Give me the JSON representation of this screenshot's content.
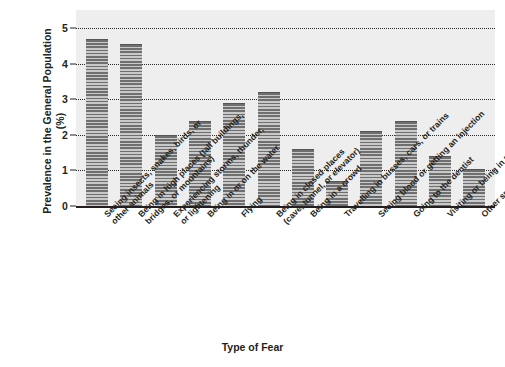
{
  "chart_data": {
    "type": "bar",
    "title": "",
    "xlabel": "Type of Fear",
    "ylabel": "Prevalence in the General Population (%)",
    "ylabel_lines": [
      "Prevalence in the",
      "General Population (%)"
    ],
    "ylim": [
      0,
      5
    ],
    "yticks": [
      0,
      1,
      2,
      3,
      4,
      5
    ],
    "ytick_labels": [
      "0",
      "1",
      "2",
      "3",
      "4",
      "5"
    ],
    "grid": true,
    "grid_style": "dotted horizontal",
    "legend": null,
    "bar_color": "#8c8c8c",
    "bar_pattern": "horizontal-hatch",
    "plot_background": "#eeeeee",
    "categories": [
      "Seeing insects, snakes, birds, or other animals",
      "Being in high places (tall buildings, bridges, or mountains)",
      "Experiencing storms, thunder, or lightening",
      "Being in or on the water",
      "Flying",
      "Being in closed places (cave, tunnel, or elevator)",
      "Being in a crowd",
      "Travelling in busses, cars, or trains",
      "Seeing blood or getting an injection",
      "Going to the dentist",
      "Visiting or being in the hospital",
      "Other specific objects or situations"
    ],
    "category_lines": [
      [
        "Seeing insects, snakes, birds, or",
        "other animals"
      ],
      [
        "Being in high places (tall buildings,",
        "bridges, or mountains)"
      ],
      [
        "Experiencing storms, thunder,",
        "or lightening"
      ],
      [
        "Being in or on the water"
      ],
      [
        "Flying"
      ],
      [
        "Being in closed places",
        "(cave, tunnel, or elevator)"
      ],
      [
        "Being in a crowd"
      ],
      [
        "Travelling in busses, cars, or trains"
      ],
      [
        "Seeing blood or getting an injection"
      ],
      [
        "Going to the dentist"
      ],
      [
        "Visiting or being in the hospital"
      ],
      [
        "Other specific objects or situations"
      ]
    ],
    "values": [
      4.7,
      4.55,
      2.0,
      2.4,
      2.9,
      3.2,
      1.6,
      0.7,
      2.1,
      2.4,
      1.4,
      1.05
    ]
  }
}
